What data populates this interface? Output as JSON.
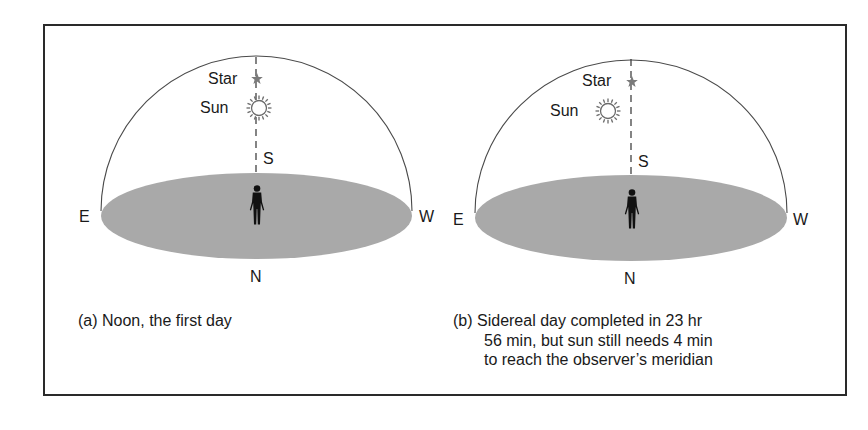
{
  "panels": [
    {
      "id": "a",
      "labels": {
        "star": "Star",
        "sun": "Sun",
        "south": "S",
        "east": "E",
        "west": "W",
        "north": "N"
      },
      "caption": [
        "(a) Noon, the first day"
      ]
    },
    {
      "id": "b",
      "labels": {
        "star": "Star",
        "sun": "Sun",
        "south": "S",
        "east": "E",
        "west": "W",
        "north": "N"
      },
      "caption": [
        "(b) Sidereal day completed in 23 hr",
        "56 min, but sun still needs 4 min",
        "to reach the observer’s meridian"
      ]
    }
  ],
  "colors": {
    "horizon_plane": "#a9a9a9",
    "dome_line": "#4a4a4a",
    "star": "#7a7a7a",
    "sun": "#6a6a6a",
    "frame": "#2a2a2a"
  }
}
